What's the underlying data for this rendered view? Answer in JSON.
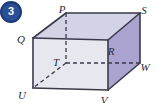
{
  "figure": {
    "badge": {
      "number": "3",
      "shape": "circle",
      "fill": "#1d3b77",
      "inner_fill": "#2b4f97",
      "text_color": "#ffffff",
      "cx": 11,
      "cy": 12,
      "r": 11
    },
    "type": "3d-solid-cuboid",
    "colors": {
      "top_face": "#d3d3e6",
      "front_face": "#e6e7ef",
      "right_face": "#aaa2cf",
      "edge": "#3a3a4c",
      "hidden_edge": "#3a3a4c",
      "label": "#2b2b38"
    },
    "edge_width": 1.6,
    "hidden_edge_dash": "4,3",
    "vertices": [
      {
        "name": "P",
        "x": 66,
        "y": 13,
        "label_x": 62,
        "label_y": 10,
        "hidden": false
      },
      {
        "name": "S",
        "x": 140,
        "y": 13,
        "label_x": 144,
        "label_y": 11,
        "hidden": false
      },
      {
        "name": "Q",
        "x": 33,
        "y": 38,
        "label_x": 21,
        "label_y": 40,
        "hidden": false
      },
      {
        "name": "R",
        "x": 108,
        "y": 40,
        "label_x": 111,
        "label_y": 52,
        "hidden": false
      },
      {
        "name": "T",
        "x": 66,
        "y": 63,
        "label_x": 56,
        "label_y": 63,
        "hidden": true
      },
      {
        "name": "W",
        "x": 140,
        "y": 63,
        "label_x": 145,
        "label_y": 68,
        "hidden": false
      },
      {
        "name": "U",
        "x": 33,
        "y": 88,
        "label_x": 22,
        "label_y": 96,
        "hidden": false
      },
      {
        "name": "V",
        "x": 108,
        "y": 90,
        "label_x": 104,
        "label_y": 101,
        "hidden": false
      }
    ],
    "faces": [
      {
        "name": "top-face",
        "points": "33,38 66,13 140,13 108,40",
        "fill": "#d3d3e6"
      },
      {
        "name": "front-face",
        "points": "33,38 108,40 108,90 33,88",
        "fill": "#e6e7ef"
      },
      {
        "name": "right-face",
        "points": "108,40 140,13 140,63 108,90",
        "fill": "#aaa2cf"
      }
    ],
    "visible_edges": [
      {
        "name": "edge-Q-P",
        "x1": 33,
        "y1": 38,
        "x2": 66,
        "y2": 13
      },
      {
        "name": "edge-P-S",
        "x1": 66,
        "y1": 13,
        "x2": 140,
        "y2": 13
      },
      {
        "name": "edge-S-W",
        "x1": 140,
        "y1": 13,
        "x2": 140,
        "y2": 63
      },
      {
        "name": "edge-S-R",
        "x1": 140,
        "y1": 13,
        "x2": 108,
        "y2": 40
      },
      {
        "name": "edge-Q-R",
        "x1": 33,
        "y1": 38,
        "x2": 108,
        "y2": 40
      },
      {
        "name": "edge-Q-U",
        "x1": 33,
        "y1": 38,
        "x2": 33,
        "y2": 88
      },
      {
        "name": "edge-R-V",
        "x1": 108,
        "y1": 40,
        "x2": 108,
        "y2": 90
      },
      {
        "name": "edge-U-V",
        "x1": 33,
        "y1": 88,
        "x2": 108,
        "y2": 90
      },
      {
        "name": "edge-V-W",
        "x1": 108,
        "y1": 90,
        "x2": 140,
        "y2": 63
      }
    ],
    "hidden_edges": [
      {
        "name": "edge-P-T",
        "x1": 66,
        "y1": 13,
        "x2": 66,
        "y2": 63
      },
      {
        "name": "edge-T-W",
        "x1": 66,
        "y1": 63,
        "x2": 140,
        "y2": 63
      },
      {
        "name": "edge-T-U",
        "x1": 66,
        "y1": 63,
        "x2": 33,
        "y2": 88
      }
    ]
  }
}
